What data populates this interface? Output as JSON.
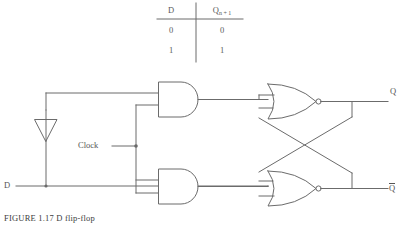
{
  "figure": {
    "caption": "FIGURE 1.17   D flip-flop",
    "stroke_color": "#6b6b6b",
    "text_color": "#555555",
    "background": "#ffffff"
  },
  "truth_table": {
    "headers": [
      "D",
      "Q"
    ],
    "header_q_subscript": "n + 1",
    "rows": [
      {
        "d": "0",
        "q": "0"
      },
      {
        "d": "1",
        "q": "1"
      }
    ]
  },
  "signals": {
    "clock_label": "Clock",
    "d_input_label": "D",
    "q_output_label": "Q",
    "qbar_output_label": "Q"
  },
  "gates": [
    {
      "name": "inverter",
      "type": "NOT",
      "bubble": true
    },
    {
      "name": "and-gate-top",
      "type": "AND",
      "inputs": 2,
      "bubble": false
    },
    {
      "name": "and-gate-bottom",
      "type": "AND",
      "inputs": 2,
      "bubble": false
    },
    {
      "name": "nor-gate-top",
      "type": "NOR",
      "inputs": 2,
      "bubble": true
    },
    {
      "name": "nor-gate-bottom",
      "type": "NOR",
      "inputs": 2,
      "bubble": true
    }
  ]
}
